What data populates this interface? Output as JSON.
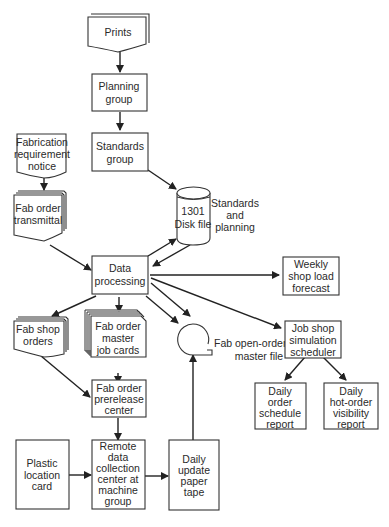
{
  "diagram": {
    "type": "flowchart",
    "nodes": {
      "prints": {
        "shape": "document-stack",
        "lines": [
          "Prints"
        ]
      },
      "planning_group": {
        "shape": "process",
        "lines": [
          "Planning",
          "group"
        ]
      },
      "standards_group": {
        "shape": "process",
        "lines": [
          "Standards",
          "group"
        ]
      },
      "disk_file": {
        "shape": "cylinder",
        "lines": [
          "1301",
          "Disk file"
        ],
        "side_label": [
          "Standards",
          "and",
          "planning"
        ]
      },
      "fab_req_notice": {
        "shape": "document",
        "lines": [
          "Fabrication",
          "requirement",
          "notice"
        ]
      },
      "fab_order_transmittal": {
        "shape": "document-stack",
        "lines": [
          "Fab order",
          "transmittal"
        ]
      },
      "data_processing": {
        "shape": "process",
        "lines": [
          "Data",
          "processing"
        ]
      },
      "weekly_forecast": {
        "shape": "process",
        "lines": [
          "Weekly",
          "shop load",
          "forecast"
        ]
      },
      "fab_shop_orders": {
        "shape": "document-stack",
        "lines": [
          "Fab shop",
          "orders"
        ]
      },
      "fab_job_cards": {
        "shape": "card-stack",
        "lines": [
          "Fab order",
          "master",
          "job cards"
        ]
      },
      "open_order_file": {
        "shape": "tape-reel",
        "side_label": [
          "Fab open-order",
          "master file"
        ]
      },
      "job_shop_sim": {
        "shape": "process",
        "lines": [
          "Job shop",
          "simulation",
          "scheduler"
        ]
      },
      "prerelease_center": {
        "shape": "process",
        "lines": [
          "Fab order",
          "prerelease",
          "center"
        ]
      },
      "daily_schedule": {
        "shape": "process",
        "lines": [
          "Daily",
          "order",
          "schedule",
          "report"
        ]
      },
      "daily_hot_order": {
        "shape": "process",
        "lines": [
          "Daily",
          "hot-order",
          "visibility",
          "report"
        ]
      },
      "plastic_card": {
        "shape": "process",
        "lines": [
          "Plastic",
          "location",
          "card"
        ]
      },
      "remote_center": {
        "shape": "process",
        "lines": [
          "Remote",
          "data",
          "collection",
          "center at",
          "machine",
          "group"
        ]
      },
      "paper_tape": {
        "shape": "process",
        "lines": [
          "Daily",
          "update",
          "paper",
          "tape"
        ]
      }
    },
    "edges": [
      {
        "from": "prints",
        "to": "planning_group"
      },
      {
        "from": "planning_group",
        "to": "standards_group"
      },
      {
        "from": "standards_group",
        "to": "disk_file"
      },
      {
        "from": "fab_req_notice",
        "to": "fab_order_transmittal"
      },
      {
        "from": "fab_order_transmittal",
        "to": "data_processing"
      },
      {
        "from": "data_processing",
        "to": "disk_file"
      },
      {
        "from": "disk_file",
        "to": "data_processing"
      },
      {
        "from": "data_processing",
        "to": "weekly_forecast"
      },
      {
        "from": "data_processing",
        "to": "fab_shop_orders"
      },
      {
        "from": "data_processing",
        "to": "fab_job_cards"
      },
      {
        "from": "data_processing",
        "to": "open_order_file"
      },
      {
        "from": "data_processing",
        "to": "open_order_file"
      },
      {
        "from": "data_processing",
        "to": "job_shop_sim"
      },
      {
        "from": "fab_shop_orders",
        "to": "prerelease_center"
      },
      {
        "from": "fab_job_cards",
        "to": "prerelease_center"
      },
      {
        "from": "prerelease_center",
        "to": "remote_center"
      },
      {
        "from": "plastic_card",
        "to": "remote_center"
      },
      {
        "from": "remote_center",
        "to": "paper_tape"
      },
      {
        "from": "paper_tape",
        "to": "open_order_file"
      },
      {
        "from": "job_shop_sim",
        "to": "daily_schedule"
      },
      {
        "from": "job_shop_sim",
        "to": "daily_hot_order"
      }
    ]
  }
}
